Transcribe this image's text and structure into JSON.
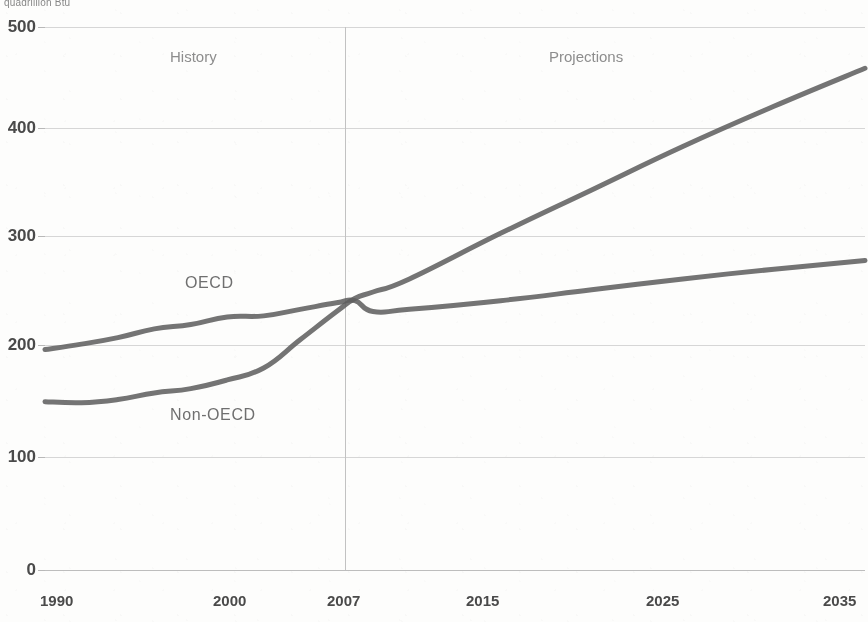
{
  "chart_data": {
    "type": "line",
    "title": "",
    "unit_label": "quadrillion Btu",
    "xlabel": "",
    "ylabel": "",
    "ylim": [
      0,
      500
    ],
    "xlim": [
      1990,
      2035
    ],
    "grid": true,
    "legend_position": "inline-annotation",
    "ytick_labels": [
      "500",
      "400",
      "300",
      "200",
      "100",
      "0"
    ],
    "ytick_values": [
      500,
      400,
      300,
      200,
      100,
      0
    ],
    "xtick_labels": [
      "1990",
      "2000",
      "2007",
      "2015",
      "2025",
      "2035"
    ],
    "xtick_values": [
      1990,
      2000,
      2007,
      2015,
      2025,
      2035
    ],
    "annotations": [
      {
        "text": "History",
        "x": 1998,
        "y": 470
      },
      {
        "text": "Projections",
        "x": 2018,
        "y": 470
      },
      {
        "text": "OECD",
        "x": 1997,
        "y": 268
      },
      {
        "text": "Non-OECD",
        "x": 1997,
        "y": 160
      }
    ],
    "divider_year": 2007,
    "x": [
      1990,
      1992,
      1994,
      1996,
      1998,
      2000,
      2002,
      2004,
      2006,
      2007,
      2008,
      2010,
      2015,
      2020,
      2025,
      2030,
      2035
    ],
    "series": [
      {
        "name": "OECD",
        "values": [
          203,
          208,
          214,
          222,
          226,
          233,
          234,
          240,
          246,
          248,
          238,
          240,
          248,
          258,
          268,
          277,
          285
        ]
      },
      {
        "name": "Non-OECD",
        "values": [
          155,
          154,
          157,
          163,
          167,
          175,
          186,
          212,
          238,
          250,
          256,
          268,
          310,
          350,
          390,
          427,
          462
        ]
      }
    ]
  },
  "axis": {
    "unit_label": "quadrillion Btu"
  },
  "labels": {
    "history": "History",
    "projections": "Projections",
    "oecd": "OECD",
    "non_oecd": "Non-OECD"
  },
  "yticks": [
    {
      "label": "500"
    },
    {
      "label": "400"
    },
    {
      "label": "300"
    },
    {
      "label": "200"
    },
    {
      "label": "100"
    },
    {
      "label": "0"
    }
  ],
  "xticks": [
    {
      "label": "1990"
    },
    {
      "label": "2000"
    },
    {
      "label": "2007"
    },
    {
      "label": "2015"
    },
    {
      "label": "2025"
    },
    {
      "label": "2035"
    }
  ]
}
